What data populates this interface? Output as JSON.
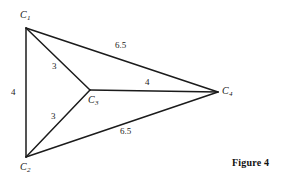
{
  "figure": {
    "caption": "Figure 4",
    "background_color": "#ffffff",
    "ink_color": "#1b1b1b"
  },
  "chart_data": {
    "type": "diagram",
    "title": "Figure 4",
    "subtitle": "",
    "xlabel": "",
    "ylabel": "",
    "nodes": [
      {
        "id": "C1",
        "label": "C",
        "sub": "1",
        "x": 26,
        "y": 28,
        "label_x": 20,
        "label_y": 10
      },
      {
        "id": "C2",
        "label": "C",
        "sub": "2",
        "x": 26,
        "y": 157,
        "label_x": 20,
        "label_y": 162
      },
      {
        "id": "C3",
        "label": "C",
        "sub": "3",
        "x": 90,
        "y": 90,
        "label_x": 88,
        "label_y": 95
      },
      {
        "id": "C4",
        "label": "C",
        "sub": "4",
        "x": 218,
        "y": 92,
        "label_x": 222,
        "label_y": 86
      }
    ],
    "edges": [
      {
        "from": "C1",
        "to": "C2",
        "weight": "4",
        "label_x": 11,
        "label_y": 88
      },
      {
        "from": "C1",
        "to": "C3",
        "weight": "3",
        "label_x": 52,
        "label_y": 62
      },
      {
        "from": "C1",
        "to": "C4",
        "weight": "6.5",
        "label_x": 115,
        "label_y": 41
      },
      {
        "from": "C2",
        "to": "C3",
        "weight": "3",
        "label_x": 51,
        "label_y": 112
      },
      {
        "from": "C2",
        "to": "C4",
        "weight": "6.5",
        "label_x": 120,
        "label_y": 127
      },
      {
        "from": "C3",
        "to": "C4",
        "weight": "4",
        "label_x": 145,
        "label_y": 78
      }
    ],
    "legend": [],
    "grid": false
  }
}
